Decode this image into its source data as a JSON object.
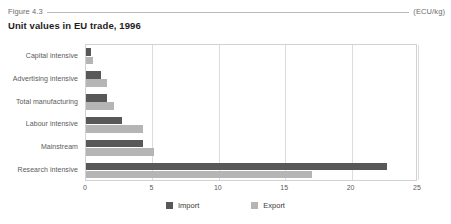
{
  "header": {
    "figure_number": "Figure 4.3",
    "unit": "(ECU/kg)",
    "title": "Unit values in EU trade, 1996"
  },
  "chart_data": {
    "type": "bar",
    "orientation": "horizontal",
    "title": "Unit values in EU trade, 1996",
    "xlabel": "",
    "ylabel": "",
    "unit": "(ECU/kg)",
    "xlim": [
      0,
      25
    ],
    "xticks": [
      0,
      5,
      10,
      15,
      20,
      25
    ],
    "xtick_labels": [
      "0",
      "5",
      "10",
      "15",
      "20",
      "25"
    ],
    "grid": true,
    "legend_position": "bottom",
    "categories": [
      "Capital intensive",
      "Advertising intensive",
      "Total manufacturing",
      "Labour intensive",
      "Mainstream",
      "Research intensive"
    ],
    "series": [
      {
        "name": "Import",
        "color": "#585858",
        "values": [
          0.4,
          1.1,
          1.6,
          2.7,
          4.3,
          22.7
        ]
      },
      {
        "name": "Export",
        "color": "#b5b5b5",
        "values": [
          0.5,
          1.6,
          2.1,
          4.3,
          5.1,
          17.0
        ]
      }
    ]
  },
  "legend": {
    "items": [
      {
        "label": "Import",
        "color": "#585858"
      },
      {
        "label": "Export",
        "color": "#b5b5b5"
      }
    ]
  }
}
